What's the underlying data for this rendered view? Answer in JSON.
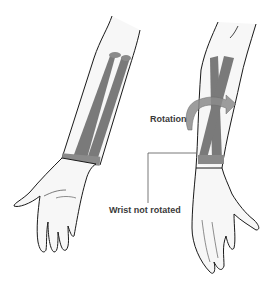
{
  "figure": {
    "labels": {
      "rotation": "Rotation",
      "wrist": "Wrist not rotated"
    },
    "colors": {
      "bone": "#7a7a7a",
      "skin_fill": "#f7f7f7",
      "outline": "#1a1a1a",
      "arrow": "#8c8c8c",
      "leader_line": "#555555"
    },
    "panels": [
      {
        "name": "left-arm",
        "description": "Forearm with parallel radius and ulna, palm up"
      },
      {
        "name": "right-arm",
        "description": "Forearm with crossed radius and ulna (rotated), wrist not rotated"
      }
    ]
  }
}
